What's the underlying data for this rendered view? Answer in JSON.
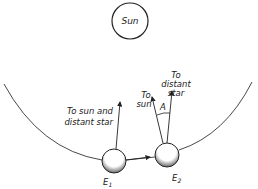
{
  "diagram": {
    "sun_label": "Sun",
    "earth1": {
      "label": "E",
      "subscript": "1"
    },
    "earth2": {
      "label": "E",
      "subscript": "2"
    },
    "arrow_e1_label_line1": "To sun and",
    "arrow_e1_label_line2": "distant star",
    "arrow_e2_sun_line1": "To",
    "arrow_e2_sun_line2": "sun",
    "arrow_e2_star_line1": "To",
    "arrow_e2_star_line2": "distant",
    "arrow_e2_star_line3": "star",
    "angle_label": "A"
  }
}
